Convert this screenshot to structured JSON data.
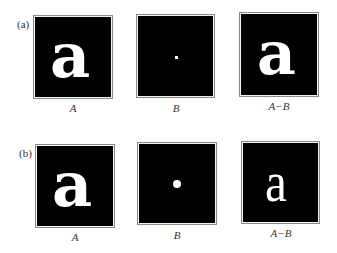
{
  "rows": [
    {
      "label": "(a)",
      "panels": [
        {
          "caption": "A",
          "content": "a",
          "kind": "letter-bold"
        },
        {
          "caption": "B",
          "content": "",
          "kind": "small-square-point"
        },
        {
          "caption": "A−B",
          "content": "a",
          "kind": "letter-slightly-eroded"
        }
      ]
    },
    {
      "label": "(b)",
      "panels": [
        {
          "caption": "A",
          "content": "a",
          "kind": "letter-bold"
        },
        {
          "caption": "B",
          "content": "",
          "kind": "disk-structuring-element"
        },
        {
          "caption": "A−B",
          "content": "a",
          "kind": "letter-heavily-eroded"
        }
      ]
    }
  ],
  "colors": {
    "background": "#ffffff",
    "image_bg": "#000000",
    "foreground": "#ffffff",
    "frame": "#8a8a8a"
  }
}
